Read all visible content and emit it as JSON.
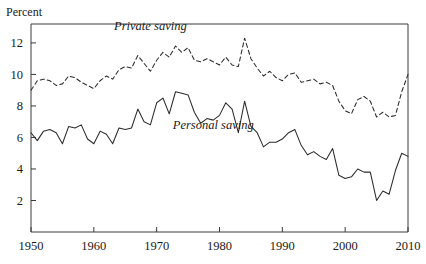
{
  "chart_data": {
    "type": "line",
    "title": "",
    "subtitle": "",
    "ylabel": "Percent",
    "xlabel": "",
    "grid": false,
    "legend_position": "inline-annotations",
    "xlim": [
      1950,
      2010
    ],
    "ylim": [
      0,
      13.2
    ],
    "x_ticks": [
      1950,
      1960,
      1970,
      1980,
      1990,
      2000,
      2010
    ],
    "x_tick_labels": [
      "1950",
      "1960",
      "1970",
      "1980",
      "1990",
      "2000",
      "2010"
    ],
    "y_ticks": [
      2,
      4,
      6,
      8,
      10,
      12
    ],
    "y_tick_labels": [
      "2",
      "4",
      "6",
      "8",
      "10",
      "12"
    ],
    "annotations": [
      {
        "text": "Private saving",
        "x": 1969,
        "y": 12.85,
        "style": "italic"
      },
      {
        "text": "Personal saving",
        "x": 1979,
        "y": 6.55,
        "style": "italic"
      }
    ],
    "x": [
      1950,
      1951,
      1952,
      1953,
      1954,
      1955,
      1956,
      1957,
      1958,
      1959,
      1960,
      1961,
      1962,
      1963,
      1964,
      1965,
      1966,
      1967,
      1968,
      1969,
      1970,
      1971,
      1972,
      1973,
      1974,
      1975,
      1976,
      1977,
      1978,
      1979,
      1980,
      1981,
      1982,
      1983,
      1984,
      1985,
      1986,
      1987,
      1988,
      1989,
      1990,
      1991,
      1992,
      1993,
      1994,
      1995,
      1996,
      1997,
      1998,
      1999,
      2000,
      2001,
      2002,
      2003,
      2004,
      2005,
      2006,
      2007,
      2008,
      2009,
      2010
    ],
    "series": [
      {
        "name": "Private saving",
        "style": "dashed",
        "color": "#2b2b2b",
        "values": [
          9.0,
          9.6,
          9.7,
          9.6,
          9.3,
          9.4,
          9.9,
          9.8,
          9.5,
          9.3,
          9.1,
          9.6,
          9.9,
          9.7,
          10.3,
          10.5,
          10.4,
          11.2,
          10.7,
          10.2,
          10.9,
          11.4,
          11.1,
          11.8,
          11.4,
          11.7,
          10.9,
          10.8,
          11.0,
          10.8,
          10.6,
          11.1,
          10.6,
          10.5,
          12.3,
          11.0,
          10.4,
          9.9,
          10.2,
          9.8,
          9.6,
          10.0,
          10.1,
          9.5,
          9.6,
          9.7,
          9.4,
          9.5,
          9.3,
          8.3,
          7.7,
          7.5,
          8.4,
          8.6,
          8.3,
          7.3,
          7.6,
          7.3,
          7.4,
          8.9,
          10.0
        ]
      },
      {
        "name": "Personal saving",
        "style": "solid",
        "color": "#2b2b2b",
        "values": [
          6.3,
          5.8,
          6.4,
          6.5,
          6.3,
          5.6,
          6.7,
          6.6,
          6.8,
          5.9,
          5.6,
          6.4,
          6.2,
          5.6,
          6.6,
          6.5,
          6.6,
          7.8,
          7.0,
          6.8,
          8.2,
          8.5,
          7.5,
          8.9,
          8.8,
          8.7,
          7.6,
          6.9,
          7.2,
          7.1,
          7.4,
          8.2,
          7.8,
          6.3,
          8.3,
          6.7,
          6.3,
          5.4,
          5.7,
          5.7,
          5.9,
          6.3,
          6.5,
          5.5,
          4.9,
          5.1,
          4.8,
          4.6,
          5.3,
          3.6,
          3.4,
          3.5,
          4.0,
          3.8,
          3.8,
          2.0,
          2.6,
          2.4,
          3.9,
          5.0,
          4.8
        ]
      }
    ]
  },
  "figure": {
    "caption": "",
    "source_note": ""
  }
}
